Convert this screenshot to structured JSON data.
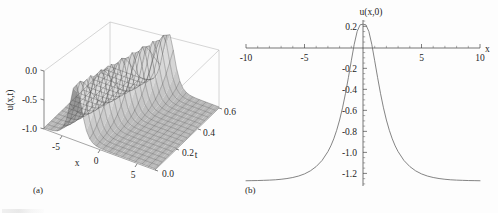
{
  "figure": {
    "background": "#fdfdfd",
    "curve_color": "#6e6e6e",
    "axis_color": "#3a3a3a",
    "panels": [
      "a",
      "b"
    ]
  },
  "panel_a": {
    "caption": "(a)",
    "type": "surface3d",
    "zlabel": "u(x,t)",
    "xlabel": "x",
    "tlabel": "t",
    "x_ticks": [
      "-5",
      "0",
      "5"
    ],
    "t_ticks": [
      "0.0",
      "0.2",
      "0.4",
      "0.6"
    ],
    "z_ticks": [
      "0.0",
      "-0.5",
      "-1.0"
    ]
  },
  "panel_b": {
    "caption": "(b)",
    "title": "u(x,0)",
    "xlabel": "x",
    "x_ticks": [
      "-10",
      "-5",
      "5",
      "10"
    ],
    "y_ticks": [
      "0.2",
      "-0.2",
      "-0.4",
      "-0.6",
      "-0.8",
      "-1.0",
      "-1.2"
    ]
  },
  "chart_data": [
    {
      "type": "surface",
      "title": "",
      "xlabel": "x",
      "ylabel": "t",
      "zlabel": "u(x,t)",
      "xlim": [
        -7.5,
        7.5
      ],
      "ylim": [
        0.0,
        0.65
      ],
      "zlim": [
        -1.3,
        0.25
      ],
      "xticks": [
        -5,
        0,
        5
      ],
      "yticks": [
        0.0,
        0.2,
        0.4,
        0.6
      ],
      "zticks": [
        0.0,
        -0.5,
        -1.0
      ],
      "grid": false,
      "description": "Soliton-like travelling wave: a narrow positive crest riding on a negative background that propagates toward increasing x as t increases.",
      "peak_amplitude": 0.22,
      "background_level": -1.27
    },
    {
      "type": "line",
      "title": "u(x,0)",
      "xlabel": "x",
      "ylabel": "",
      "xlim": [
        -10,
        10
      ],
      "ylim": [
        -1.32,
        0.26
      ],
      "xticks": [
        -10,
        -5,
        0,
        5,
        10
      ],
      "yticks": [
        0.2,
        -0.2,
        -0.4,
        -0.6,
        -0.8,
        -1.0,
        -1.2
      ],
      "minor_tick_spacing_x": 1,
      "minor_tick_spacing_y": 0.05,
      "grid": false,
      "legend": null,
      "peak_value": 0.22,
      "peak_x": 0.0,
      "asymptote": -1.27,
      "x": [
        -10,
        -9.5,
        -9,
        -8.5,
        -8,
        -7.5,
        -7,
        -6.5,
        -6,
        -5.5,
        -5,
        -4.5,
        -4,
        -3.5,
        -3,
        -2.75,
        -2.5,
        -2.25,
        -2,
        -1.75,
        -1.5,
        -1.25,
        -1,
        -0.75,
        -0.5,
        -0.25,
        0,
        0.25,
        0.5,
        0.75,
        1,
        1.25,
        1.5,
        1.75,
        2,
        2.25,
        2.5,
        2.75,
        3,
        3.5,
        4,
        4.5,
        5,
        5.5,
        6,
        6.5,
        7,
        7.5,
        8,
        8.5,
        9,
        9.5,
        10
      ],
      "y": [
        -1.27,
        -1.269,
        -1.268,
        -1.266,
        -1.264,
        -1.261,
        -1.256,
        -1.249,
        -1.239,
        -1.225,
        -1.205,
        -1.176,
        -1.135,
        -1.077,
        -0.993,
        -0.938,
        -0.871,
        -0.79,
        -0.692,
        -0.576,
        -0.441,
        -0.289,
        -0.128,
        0.029,
        0.151,
        0.214,
        0.22,
        0.214,
        0.151,
        0.029,
        -0.128,
        -0.289,
        -0.441,
        -0.576,
        -0.692,
        -0.79,
        -0.871,
        -0.938,
        -0.993,
        -1.077,
        -1.135,
        -1.176,
        -1.205,
        -1.225,
        -1.239,
        -1.249,
        -1.256,
        -1.261,
        -1.264,
        -1.266,
        -1.268,
        -1.269,
        -1.27
      ]
    }
  ]
}
